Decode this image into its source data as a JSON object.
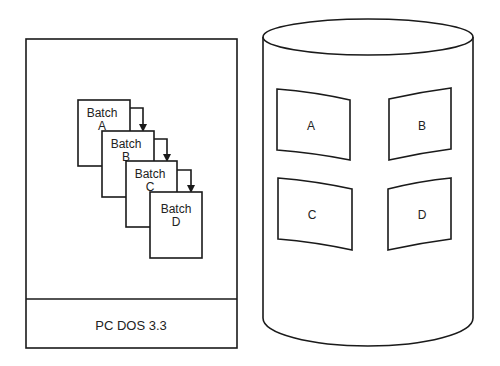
{
  "colors": {
    "stroke": "#1a1a1a",
    "background": "#ffffff",
    "text": "#222222"
  },
  "left_panel": {
    "os_label": "PC DOS 3.3",
    "batches": [
      {
        "line1": "Batch",
        "line2": "A"
      },
      {
        "line1": "Batch",
        "line2": "B"
      },
      {
        "line1": "Batch",
        "line2": "C"
      },
      {
        "line1": "Batch",
        "line2": "D"
      }
    ],
    "arrows": [
      "A-to-B",
      "B-to-C",
      "C-to-D"
    ]
  },
  "cylinder": {
    "partitions": [
      {
        "label": "A"
      },
      {
        "label": "B"
      },
      {
        "label": "C"
      },
      {
        "label": "D"
      }
    ]
  }
}
